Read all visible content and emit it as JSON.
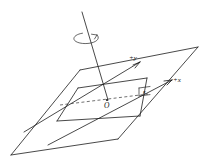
{
  "figure": {
    "background_color": "#ffffff",
    "line_color": "#1a1a1a",
    "width": 218,
    "height": 161
  },
  "labels": {
    "y_axis": "+y",
    "x_axis": "+x",
    "origin": "O",
    "angle": "κ"
  },
  "elements": {
    "rotation_axis_name": "vertical-rotation-axis",
    "rotation_arrow_name": "rotation-direction-arrow",
    "outer_plane_name": "outer-reference-plane",
    "inner_plane_name": "inner-reference-plane",
    "dashed_reference_name": "dashed-reference-line"
  }
}
